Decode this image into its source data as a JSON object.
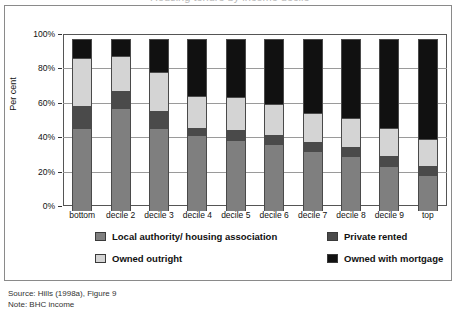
{
  "topcut": {
    "ghost_text": "Housing tenure by income decile"
  },
  "chart_data": {
    "type": "bar",
    "stacked": true,
    "title": "",
    "xlabel": "",
    "ylabel": "Per cent",
    "ylim": [
      0,
      100
    ],
    "ytick_labels": [
      "0%",
      "20%",
      "40%",
      "60%",
      "80%",
      "100%"
    ],
    "ytick_values": [
      0,
      20,
      40,
      60,
      80,
      100
    ],
    "grid": true,
    "legend_position": "bottom",
    "categories": [
      "bottom",
      "decile 2",
      "decile 3",
      "decile 4",
      "decile 5",
      "decile 6",
      "decile 7",
      "decile 8",
      "decile 9",
      "top"
    ],
    "series": [
      {
        "name": "Local authority/ housing association",
        "color": "#7f7f7f",
        "values": [
          48,
          60,
          48,
          44,
          41,
          39,
          35,
          32,
          26,
          21
        ]
      },
      {
        "name": "Private rented",
        "color": "#4a4a4a",
        "values": [
          13,
          10,
          10,
          4,
          6,
          5,
          5,
          5,
          6,
          5
        ]
      },
      {
        "name": "Owned outright",
        "color": "#d4d4d4",
        "values": [
          28,
          20,
          23,
          19,
          19,
          18,
          17,
          17,
          16,
          16
        ]
      },
      {
        "name": "Owned with mortgage",
        "color": "#111111",
        "values": [
          11,
          10,
          19,
          33,
          34,
          38,
          43,
          46,
          52,
          58
        ]
      }
    ]
  },
  "legend": {
    "items": [
      {
        "label": "Local authority/ housing association",
        "color": "#7f7f7f"
      },
      {
        "label": "Private rented",
        "color": "#4a4a4a"
      },
      {
        "label": "Owned outright",
        "color": "#d4d4d4"
      },
      {
        "label": "Owned with mortgage",
        "color": "#111111"
      }
    ]
  },
  "notes": {
    "source": "Source: Hills (1998a), Figure 9",
    "note": "Note: BHC income"
  }
}
